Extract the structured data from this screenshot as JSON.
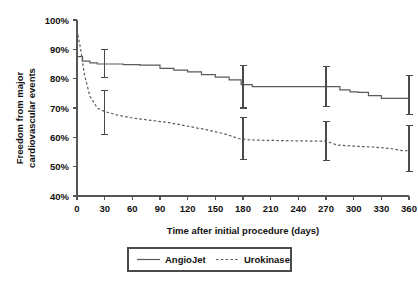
{
  "chart_data": {
    "type": "line",
    "title": "",
    "subtitle": "",
    "xlabel": "Time after initial procedure (days)",
    "ylabel": "Freedom from major cardiovascular events",
    "ylabel_line1": "Freedom from major",
    "ylabel_line2": "cardiovascular events",
    "xlim": [
      0,
      360
    ],
    "ylim": [
      40,
      100
    ],
    "xticks": [
      0,
      30,
      60,
      90,
      120,
      150,
      180,
      210,
      240,
      270,
      300,
      330,
      360
    ],
    "xtick_labels": [
      "0",
      "30",
      "60",
      "90",
      "120",
      "150",
      "180",
      "210",
      "240",
      "270",
      "300",
      "330",
      "360"
    ],
    "yticks": [
      40,
      50,
      60,
      70,
      80,
      90,
      100
    ],
    "ytick_labels": [
      "40%",
      "50%",
      "60%",
      "70%",
      "80%",
      "90%",
      "100%"
    ],
    "grid": false,
    "legend_position": "bottom-center",
    "legend_entries": [
      {
        "name": "AngioJet",
        "style": "solid"
      },
      {
        "name": "Urokinase",
        "style": "dashed"
      }
    ],
    "series": [
      {
        "name": "AngioJet",
        "style": "solid",
        "step": true,
        "x": [
          0,
          6,
          14,
          22,
          30,
          50,
          68,
          90,
          105,
          120,
          135,
          150,
          165,
          178,
          190,
          205,
          222,
          240,
          258,
          270,
          285,
          296,
          305,
          316,
          330,
          345,
          360
        ],
        "values": [
          87.5,
          86.0,
          85.4,
          85.0,
          85.0,
          84.8,
          84.6,
          83.5,
          82.9,
          82.3,
          81.4,
          80.5,
          79.6,
          78.0,
          77.3,
          77.3,
          77.3,
          77.3,
          77.3,
          77.3,
          76.2,
          75.5,
          75.3,
          74.2,
          73.3,
          73.3,
          73.3
        ]
      },
      {
        "name": "Urokinase",
        "style": "dashed",
        "step": false,
        "x": [
          0,
          4,
          8,
          14,
          22,
          30,
          45,
          60,
          80,
          100,
          120,
          140,
          160,
          175,
          185,
          200,
          220,
          240,
          258,
          270,
          282,
          300,
          320,
          340,
          352,
          360
        ],
        "values": [
          96.5,
          90.0,
          81.5,
          74.0,
          70.0,
          68.8,
          67.5,
          66.6,
          65.8,
          65.0,
          63.8,
          62.6,
          61.2,
          59.6,
          59.2,
          59.0,
          58.9,
          58.8,
          58.7,
          58.7,
          57.4,
          57.0,
          56.7,
          56.2,
          55.5,
          55.4
        ]
      }
    ],
    "error_bars": [
      {
        "series": "AngioJet",
        "x": 30,
        "value": 85.0,
        "low": 80.3,
        "high": 89.8
      },
      {
        "series": "AngioJet",
        "x": 180,
        "value": 77.3,
        "high": 84.6,
        "low": 70.0
      },
      {
        "series": "AngioJet",
        "x": 270,
        "value": 77.3,
        "high": 84.0,
        "low": 70.6
      },
      {
        "series": "AngioJet",
        "x": 360,
        "value": 73.3,
        "high": 81.0,
        "low": 67.8
      },
      {
        "series": "Urokinase",
        "x": 30,
        "value": 68.8,
        "high": 76.0,
        "low": 61.0
      },
      {
        "series": "Urokinase",
        "x": 180,
        "value": 59.4,
        "high": 66.8,
        "low": 52.5
      },
      {
        "series": "Urokinase",
        "x": 270,
        "value": 58.7,
        "high": 65.5,
        "low": 52.0
      },
      {
        "series": "Urokinase",
        "x": 360,
        "value": 55.4,
        "high": 64.0,
        "low": 48.5
      }
    ]
  }
}
